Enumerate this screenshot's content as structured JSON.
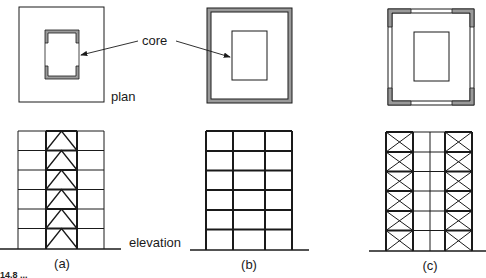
{
  "figure": {
    "labels": {
      "core": "core",
      "plan": "plan",
      "elevation": "elevation"
    },
    "panels": [
      {
        "id": "a",
        "label": "(a)",
        "system": "braced core",
        "storeys": 6,
        "bays": 3,
        "bracing": "chevron in central bay"
      },
      {
        "id": "b",
        "label": "(b)",
        "system": "perimeter moment frame",
        "storeys": 6,
        "bays": 3,
        "bracing": "none"
      },
      {
        "id": "c",
        "label": "(c)",
        "system": "braced perimeter corners",
        "storeys": 6,
        "bays": 4,
        "bracing": "X-bracing in outer bays"
      }
    ],
    "caption_fragment": "14.8 ...",
    "colors": {
      "line": "#1a1a1a",
      "wall_fill": "#9a9a9a",
      "background": "#ffffff"
    }
  }
}
